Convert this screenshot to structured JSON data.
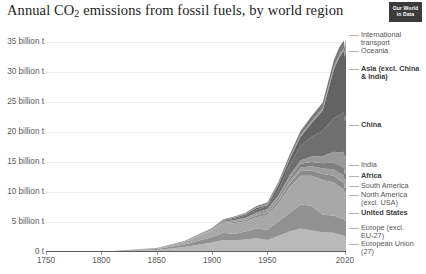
{
  "header": {
    "title_main": "Annual CO",
    "title_sub": "2",
    "title_rest": " emissions from fossil fuels, by world region",
    "logo_line1": "Our World",
    "logo_line2": "in Data"
  },
  "chart_data": {
    "type": "area",
    "title": "Annual CO2 emissions from fossil fuels, by world region",
    "xlabel": "",
    "ylabel": "",
    "unit": "billion t",
    "grid": true,
    "legend_position": "right",
    "xlim": [
      1750,
      2021
    ],
    "ylim": [
      0,
      37
    ],
    "ytick_labels": [
      "35 billion t",
      "30 billion t",
      "25 billion t",
      "20 billion t",
      "15 billion t",
      "10 billion t",
      "5 billion t",
      "0 t"
    ],
    "ytick_values": [
      35,
      30,
      25,
      20,
      15,
      10,
      5,
      0
    ],
    "xtick_labels": [
      "1750",
      "1800",
      "1850",
      "1900",
      "1950",
      "2020"
    ],
    "xtick_values": [
      1750,
      1800,
      1850,
      1900,
      1950,
      2020
    ],
    "x": [
      1750,
      1800,
      1850,
      1875,
      1900,
      1910,
      1920,
      1930,
      1940,
      1950,
      1960,
      1970,
      1980,
      1990,
      2000,
      2010,
      2015,
      2019,
      2020,
      2021
    ],
    "series": [
      {
        "name": "European Union (27)",
        "color": "#b9b9b9",
        "values": [
          0.01,
          0.03,
          0.35,
          0.85,
          1.6,
          2.0,
          1.9,
          2.1,
          2.3,
          2.0,
          2.7,
          3.4,
          3.9,
          3.6,
          3.3,
          3.2,
          2.9,
          2.7,
          2.5,
          2.6
        ]
      },
      {
        "name": "Europe (excl. EU-27)",
        "color": "#919191",
        "values": [
          0.0,
          0.02,
          0.15,
          0.4,
          0.9,
          1.2,
          1.1,
          1.3,
          1.6,
          1.7,
          2.4,
          3.1,
          4.0,
          4.1,
          2.9,
          2.9,
          2.8,
          2.8,
          2.6,
          2.7
        ]
      },
      {
        "name": "United States",
        "color": "#a8a8a8",
        "values": [
          0.0,
          0.01,
          0.1,
          0.4,
          1.0,
          1.5,
          1.8,
          1.7,
          1.9,
          2.5,
          3.0,
          4.3,
          4.8,
          5.0,
          5.8,
          5.5,
          5.2,
          5.0,
          4.5,
          4.7
        ]
      },
      {
        "name": "North America (excl. USA)",
        "color": "#8b8b8b",
        "values": [
          0.0,
          0.0,
          0.01,
          0.03,
          0.1,
          0.15,
          0.2,
          0.25,
          0.3,
          0.35,
          0.45,
          0.6,
          0.8,
          0.9,
          1.0,
          1.1,
          1.1,
          1.1,
          1.0,
          1.0
        ]
      },
      {
        "name": "South America",
        "color": "#9e9e9e",
        "values": [
          0.0,
          0.0,
          0.01,
          0.02,
          0.05,
          0.08,
          0.1,
          0.12,
          0.15,
          0.2,
          0.3,
          0.45,
          0.6,
          0.7,
          0.9,
          1.1,
          1.2,
          1.2,
          1.1,
          1.1
        ]
      },
      {
        "name": "Africa",
        "color": "#7e7e7e",
        "values": [
          0.0,
          0.0,
          0.01,
          0.02,
          0.04,
          0.06,
          0.1,
          0.12,
          0.15,
          0.2,
          0.3,
          0.45,
          0.6,
          0.7,
          0.9,
          1.1,
          1.2,
          1.3,
          1.3,
          1.3
        ]
      },
      {
        "name": "India",
        "color": "#999999",
        "values": [
          0.0,
          0.0,
          0.01,
          0.02,
          0.05,
          0.08,
          0.1,
          0.12,
          0.15,
          0.2,
          0.3,
          0.4,
          0.6,
          0.9,
          1.2,
          1.8,
          2.2,
          2.6,
          2.4,
          2.7
        ]
      },
      {
        "name": "Asia (excl. China & India)",
        "color": "#6f6f6f",
        "values": [
          0.0,
          0.0,
          0.01,
          0.03,
          0.1,
          0.15,
          0.25,
          0.35,
          0.5,
          0.5,
          0.9,
          1.8,
          2.4,
          3.3,
          4.2,
          5.6,
          6.2,
          6.6,
          6.4,
          6.6
        ]
      },
      {
        "name": "China",
        "color": "#636363",
        "values": [
          0.0,
          0.0,
          0.01,
          0.02,
          0.05,
          0.08,
          0.15,
          0.2,
          0.3,
          0.2,
          0.8,
          0.9,
          1.5,
          2.3,
          3.4,
          8.1,
          9.7,
          10.2,
          10.7,
          11.5
        ]
      },
      {
        "name": "Oceania",
        "color": "#9a9a9a",
        "values": [
          0.0,
          0.0,
          0.01,
          0.02,
          0.04,
          0.06,
          0.08,
          0.1,
          0.12,
          0.15,
          0.2,
          0.25,
          0.3,
          0.35,
          0.4,
          0.45,
          0.45,
          0.45,
          0.42,
          0.43
        ]
      },
      {
        "name": "International transport",
        "color": "#7a7a7a",
        "values": [
          0.0,
          0.0,
          0.01,
          0.02,
          0.05,
          0.08,
          0.12,
          0.15,
          0.2,
          0.25,
          0.35,
          0.5,
          0.7,
          0.8,
          0.9,
          1.1,
          1.2,
          1.3,
          0.9,
          1.0
        ]
      }
    ]
  },
  "legend": [
    {
      "label": "International\ntransport",
      "bold": false,
      "top": 31
    },
    {
      "label": "Oceania",
      "bold": false,
      "top": 47
    },
    {
      "label": "Asia (excl. China\n& India)",
      "bold": true,
      "top": 65
    },
    {
      "label": "China",
      "bold": true,
      "top": 121
    },
    {
      "label": "India",
      "bold": false,
      "top": 161
    },
    {
      "label": "Africa",
      "bold": true,
      "top": 172
    },
    {
      "label": "South America",
      "bold": false,
      "top": 182
    },
    {
      "label": "North America\n(excl. USA)",
      "bold": false,
      "top": 191
    },
    {
      "label": "United States",
      "bold": true,
      "top": 209
    },
    {
      "label": "Europe (excl.\nEU-27)",
      "bold": false,
      "top": 224
    },
    {
      "label": "European Union\n(27)",
      "bold": false,
      "top": 240
    }
  ]
}
